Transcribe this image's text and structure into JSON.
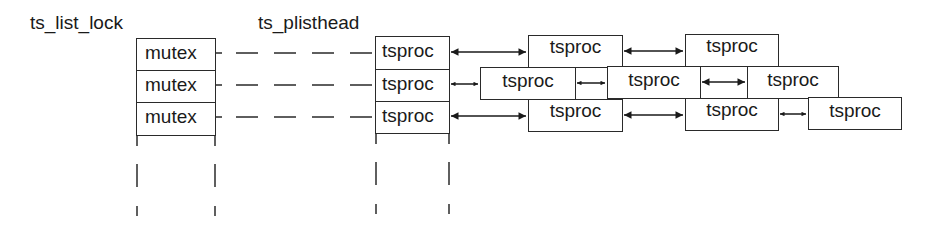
{
  "labels": {
    "list_lock": "ts_list_lock",
    "plisthead": "ts_plisthead"
  },
  "mutex_column": [
    "mutex",
    "mutex",
    "mutex"
  ],
  "head_column": [
    "tsproc",
    "tsproc",
    "tsproc"
  ],
  "chains": {
    "row1": [
      "tsproc",
      "tsproc"
    ],
    "row2": [
      "tsproc",
      "tsproc",
      "tsproc"
    ],
    "row3": [
      "tsproc",
      "tsproc",
      "tsproc"
    ]
  }
}
